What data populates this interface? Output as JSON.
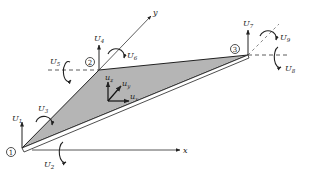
{
  "diagram": {
    "colors": {
      "line": "#222222",
      "plate_fill": "#b5b5b5",
      "edge_highlight": "#ffffff",
      "background": "#ffffff"
    },
    "global_axes": {
      "x_label": "x",
      "y_label": "y"
    },
    "nodes": [
      {
        "id": "1",
        "label": "1",
        "dofs": {
          "vertical": "U",
          "vertical_sub": "1",
          "rot_a": "U",
          "rot_a_sub": "2",
          "rot_b": "U",
          "rot_b_sub": "3"
        }
      },
      {
        "id": "2",
        "label": "2",
        "dofs": {
          "vertical": "U",
          "vertical_sub": "4",
          "rot_a": "U",
          "rot_a_sub": "5",
          "rot_b": "U",
          "rot_b_sub": "6"
        }
      },
      {
        "id": "3",
        "label": "3",
        "dofs": {
          "vertical": "U",
          "vertical_sub": "7",
          "rot_a": "U",
          "rot_a_sub": "8",
          "rot_b": "U",
          "rot_b_sub": "9"
        }
      }
    ],
    "local_axes": {
      "z": {
        "label": "u",
        "sub": "z"
      },
      "y": {
        "label": "u",
        "sub": "y"
      },
      "x": {
        "label": "u",
        "sub": "x"
      }
    }
  }
}
